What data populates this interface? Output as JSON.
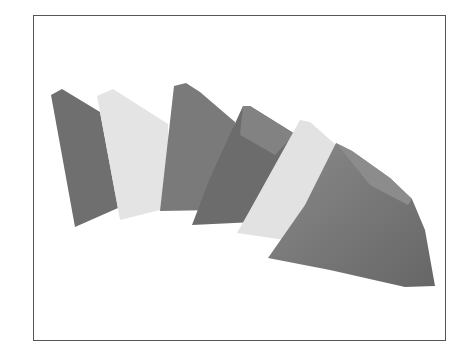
{
  "figure": {
    "slices": [
      {
        "shade": "dark",
        "color": "#6f6f6f"
      },
      {
        "shade": "light",
        "color": "#e4e4e4"
      },
      {
        "shade": "dark",
        "color": "#7a7a7a"
      },
      {
        "shade": "dark",
        "color": "#6c6c6c"
      },
      {
        "shade": "light",
        "color": "#e2e2e2"
      },
      {
        "shade": "dark",
        "color": "#727272"
      }
    ],
    "frame_color": "#555555"
  }
}
